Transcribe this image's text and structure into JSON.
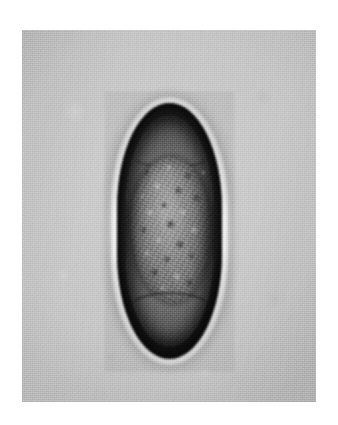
{
  "page": {
    "background_color": "#ffffff",
    "width": 338,
    "height": 425
  },
  "figure": {
    "name": "micrograph-panel",
    "kind": "light-microscopy-photomicrograph",
    "panel": {
      "x": 22,
      "y": 30,
      "width": 294,
      "height": 372,
      "background_color": "#c6c6c6",
      "texture": "halftone-print-grain"
    },
    "specimen": {
      "name": "helminth-egg",
      "shape": "lemon-shaped-ellipsoid-with-pointed-poles",
      "x": 117,
      "y": 103,
      "width": 105,
      "height": 256,
      "shell": {
        "name": "egg-shell-wall",
        "color": "#0d0d0d",
        "description": "thick dark smooth shell wall"
      },
      "halo": {
        "name": "diffraction-halo",
        "color": "#ffffff",
        "description": "bright optical halo surrounding the shell"
      },
      "cavity": {
        "name": "egg-cavity",
        "color": "#6e6e6e",
        "description": "clear space between shell and embryo, visible at both poles"
      },
      "embryo": {
        "name": "embryonic-granular-mass",
        "color": "#8e8e8e",
        "description": "coarsely granular morula filling the central portion of the egg"
      }
    }
  },
  "colors": {
    "page_white": "#ffffff",
    "plate_gray": "#c6c6c6",
    "shell_black": "#0d0d0d",
    "cavity_gray": "#6e6e6e",
    "embryo_gray": "#8e8e8e",
    "halo_white": "#ffffff"
  }
}
